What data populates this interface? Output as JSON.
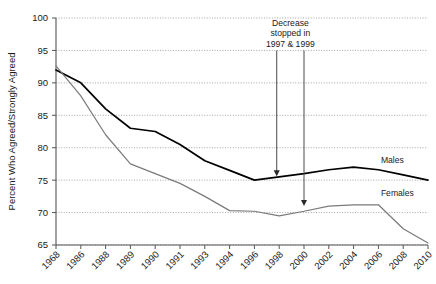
{
  "top_clipped_text": "",
  "chart_data": {
    "type": "line",
    "title": "",
    "xlabel": "",
    "ylabel": "Percent Who Agreed/Strongly Agreed",
    "ylim": [
      65,
      100
    ],
    "ytick_step": 5,
    "yticks": [
      "100",
      "95",
      "90",
      "85",
      "80",
      "75",
      "70",
      "65"
    ],
    "grid": true,
    "grid_style": "dotted-horizontal",
    "legend_position": "inline-right-of-series",
    "categories": [
      "1968",
      "1986",
      "1988",
      "1989",
      "1990",
      "1991",
      "1993",
      "1994",
      "1996",
      "1998",
      "2000",
      "2002",
      "2004",
      "2006",
      "2008",
      "2010"
    ],
    "series": [
      {
        "name": "Males",
        "color": "#000000",
        "width": 1.7,
        "values": [
          92.0,
          90.0,
          86.0,
          83.0,
          82.5,
          80.5,
          78.0,
          76.5,
          75.0,
          75.5,
          76.0,
          76.6,
          77.0,
          76.6,
          75.8,
          75.0
        ]
      },
      {
        "name": "Females",
        "color": "#7a7a7a",
        "width": 1.2,
        "values": [
          92.6,
          88.0,
          82.0,
          77.5,
          76.0,
          74.5,
          72.5,
          70.3,
          70.2,
          69.5,
          70.2,
          71.0,
          71.2,
          71.2,
          67.5,
          65.3
        ]
      }
    ],
    "annotations": [
      {
        "name": "decrease-stopped-note",
        "lines": [
          "Decrease",
          "stopped in",
          "1997 & 1999"
        ],
        "arrows": [
          {
            "name": "arrow-to-males",
            "x_year_fraction": 8.9,
            "y_from": 95.0,
            "y_to": 75.6
          },
          {
            "name": "arrow-to-females",
            "x_year_fraction": 10.0,
            "y_from": 95.0,
            "y_to": 71.0
          }
        ]
      }
    ],
    "series_labels": [
      {
        "name": "Males",
        "anchor_year_index": 13.1,
        "y": 77.6
      },
      {
        "name": "Females",
        "anchor_year_index": 13.1,
        "y": 72.6
      }
    ]
  }
}
